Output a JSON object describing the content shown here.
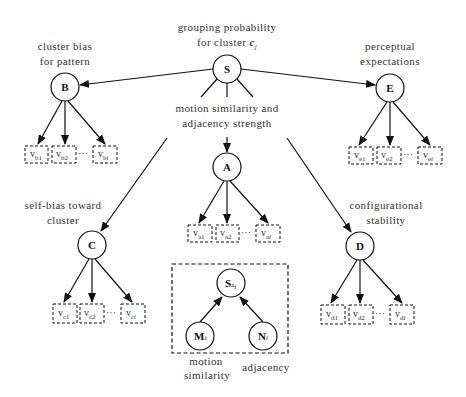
{
  "diagram": {
    "type": "hierarchical bayesian network",
    "root": {
      "id": "S",
      "label": "S",
      "caption_line1": "grouping probability",
      "caption_line2_prefix": "for cluster ",
      "caption_line2_var": "c",
      "caption_line2_sub": "j"
    },
    "edge_caption": {
      "line1": "motion similarity and",
      "line2": "adjacency strength"
    },
    "nodes": {
      "B": {
        "label": "B",
        "caption_line1": "cluster bias",
        "caption_line2": "for pattern",
        "var": "v",
        "sub": "b",
        "idx": [
          "1",
          "2",
          "i"
        ]
      },
      "E": {
        "label": "E",
        "caption_line1": "perceptual",
        "caption_line2": "expectations",
        "var": "v",
        "sub": "e",
        "idx": [
          "1",
          "2",
          "i"
        ]
      },
      "A": {
        "label": "A",
        "var": "v",
        "sub": "a",
        "idx": [
          "1",
          "2",
          "i"
        ]
      },
      "C": {
        "label": "C",
        "caption_line1": "self-bias toward",
        "caption_line2": "cluster",
        "var": "v",
        "sub": "c",
        "idx": [
          "1",
          "2",
          "i"
        ]
      },
      "D": {
        "label": "D",
        "caption_line1": "configurational",
        "caption_line2": "stability",
        "var": "v",
        "sub": "d",
        "idx": [
          "1",
          "2",
          "i"
        ]
      }
    },
    "ellipsis": "···",
    "inset": {
      "top": {
        "label": "S",
        "sub": "a",
        "subidx": "i"
      },
      "left": {
        "label": "M",
        "sub": "i",
        "caption_line1": "motion",
        "caption_line2": "similarity"
      },
      "right": {
        "label": "N",
        "sub": "i",
        "caption": "adjacency"
      }
    },
    "edges": [
      [
        "S",
        "B"
      ],
      [
        "S",
        "E"
      ],
      [
        "S",
        "A"
      ],
      [
        "S",
        "C"
      ],
      [
        "S",
        "D"
      ],
      [
        "B",
        "v_b1"
      ],
      [
        "B",
        "v_b2"
      ],
      [
        "B",
        "v_bi"
      ],
      [
        "E",
        "v_e1"
      ],
      [
        "E",
        "v_e2"
      ],
      [
        "E",
        "v_ei"
      ],
      [
        "A",
        "v_a1"
      ],
      [
        "A",
        "v_a2"
      ],
      [
        "A",
        "v_ai"
      ],
      [
        "C",
        "v_c1"
      ],
      [
        "C",
        "v_c2"
      ],
      [
        "C",
        "v_ci"
      ],
      [
        "D",
        "v_d1"
      ],
      [
        "D",
        "v_d2"
      ],
      [
        "D",
        "v_di"
      ],
      [
        "M_i",
        "S_ai"
      ],
      [
        "N_i",
        "S_ai"
      ]
    ],
    "colors": {
      "stroke": "#111111",
      "text": "#333333",
      "background": "#ffffff"
    }
  }
}
